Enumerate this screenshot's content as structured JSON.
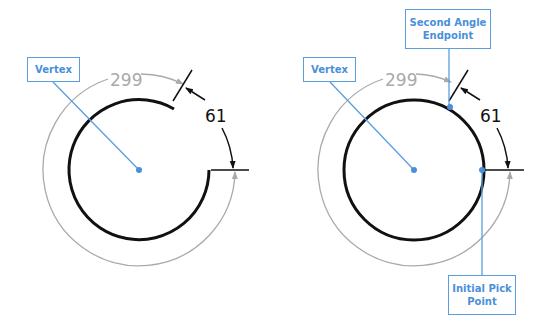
{
  "diagrams": [
    {
      "id": "left",
      "center": [
        139,
        170
      ],
      "labels": {
        "vertex": "Vertex"
      },
      "dimensions": {
        "major_angle": "299",
        "minor_angle": "61"
      }
    },
    {
      "id": "right",
      "center": [
        414,
        170
      ],
      "labels": {
        "vertex": "Vertex",
        "second_angle_endpoint": "Second Angle Endpoint",
        "initial_pick_point": "Initial Pick Point"
      },
      "dimensions": {
        "major_angle": "299",
        "minor_angle": "61"
      }
    }
  ],
  "colors": {
    "callout": "#4a90d9",
    "geometry": "#111111",
    "dimension_gray": "#aaaaaa"
  }
}
